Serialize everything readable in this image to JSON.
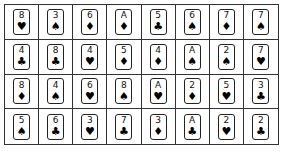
{
  "board": {
    "rows": 4,
    "cols": 8,
    "cards": [
      [
        {
          "rank": "8",
          "suit": "♥",
          "suit_name": "heart"
        },
        {
          "rank": "3",
          "suit": "♠",
          "suit_name": "spade"
        },
        {
          "rank": "6",
          "suit": "♦",
          "suit_name": "diamond"
        },
        {
          "rank": "A",
          "suit": "♦",
          "suit_name": "diamond"
        },
        {
          "rank": "5",
          "suit": "♣",
          "suit_name": "club"
        },
        {
          "rank": "6",
          "suit": "♠",
          "suit_name": "spade"
        },
        {
          "rank": "7",
          "suit": "♦",
          "suit_name": "diamond"
        },
        {
          "rank": "7",
          "suit": "♠",
          "suit_name": "spade"
        }
      ],
      [
        {
          "rank": "4",
          "suit": "♣",
          "suit_name": "club"
        },
        {
          "rank": "8",
          "suit": "♣",
          "suit_name": "club"
        },
        {
          "rank": "4",
          "suit": "♥",
          "suit_name": "heart"
        },
        {
          "rank": "5",
          "suit": "♦",
          "suit_name": "diamond"
        },
        {
          "rank": "4",
          "suit": "♦",
          "suit_name": "diamond"
        },
        {
          "rank": "A",
          "suit": "♠",
          "suit_name": "spade"
        },
        {
          "rank": "2",
          "suit": "♠",
          "suit_name": "spade"
        },
        {
          "rank": "7",
          "suit": "♥",
          "suit_name": "heart"
        }
      ],
      [
        {
          "rank": "8",
          "suit": "♦",
          "suit_name": "diamond"
        },
        {
          "rank": "4",
          "suit": "♠",
          "suit_name": "spade"
        },
        {
          "rank": "6",
          "suit": "♥",
          "suit_name": "heart"
        },
        {
          "rank": "8",
          "suit": "♠",
          "suit_name": "spade"
        },
        {
          "rank": "A",
          "suit": "♥",
          "suit_name": "heart"
        },
        {
          "rank": "2",
          "suit": "♦",
          "suit_name": "diamond"
        },
        {
          "rank": "5",
          "suit": "♥",
          "suit_name": "heart"
        },
        {
          "rank": "3",
          "suit": "♣",
          "suit_name": "club"
        }
      ],
      [
        {
          "rank": "5",
          "suit": "♠",
          "suit_name": "spade"
        },
        {
          "rank": "6",
          "suit": "♣",
          "suit_name": "club"
        },
        {
          "rank": "3",
          "suit": "♥",
          "suit_name": "heart"
        },
        {
          "rank": "7",
          "suit": "♣",
          "suit_name": "club"
        },
        {
          "rank": "3",
          "suit": "♦",
          "suit_name": "diamond"
        },
        {
          "rank": "A",
          "suit": "♣",
          "suit_name": "club"
        },
        {
          "rank": "2",
          "suit": "♥",
          "suit_name": "heart"
        },
        {
          "rank": "2",
          "suit": "♣",
          "suit_name": "club"
        }
      ]
    ]
  }
}
